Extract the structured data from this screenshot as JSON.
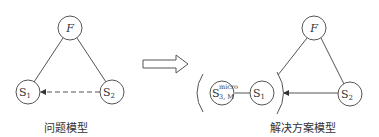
{
  "problem_model": {
    "caption": "问题模型",
    "nodes": {
      "F": {
        "label": "F"
      },
      "S1": {
        "label": "S",
        "sub": "1"
      },
      "S2": {
        "label": "S",
        "sub": "2"
      }
    },
    "edges": [
      {
        "from": "F",
        "to": "S1",
        "style": "solid"
      },
      {
        "from": "F",
        "to": "S2",
        "style": "solid"
      },
      {
        "from": "S2",
        "to": "S1",
        "style": "dashed",
        "arrow": true
      }
    ]
  },
  "transform_arrow": {
    "symbol": "⇨"
  },
  "solution_model": {
    "caption": "解决方案模型",
    "nodes": {
      "F": {
        "label": "F"
      },
      "S1": {
        "label": "S",
        "sub": "1"
      },
      "S2": {
        "label": "S",
        "sub": "2"
      },
      "S3M": {
        "label": "S",
        "sup": "micro",
        "sub": "3, M"
      }
    },
    "edges": [
      {
        "from": "F",
        "to": "S1-group",
        "style": "solid"
      },
      {
        "from": "F",
        "to": "S2",
        "style": "solid"
      },
      {
        "from": "S2",
        "to": "S1-group",
        "style": "solid",
        "arrow": true
      },
      {
        "from": "S3M",
        "to": "S1",
        "style": "solid"
      }
    ]
  }
}
